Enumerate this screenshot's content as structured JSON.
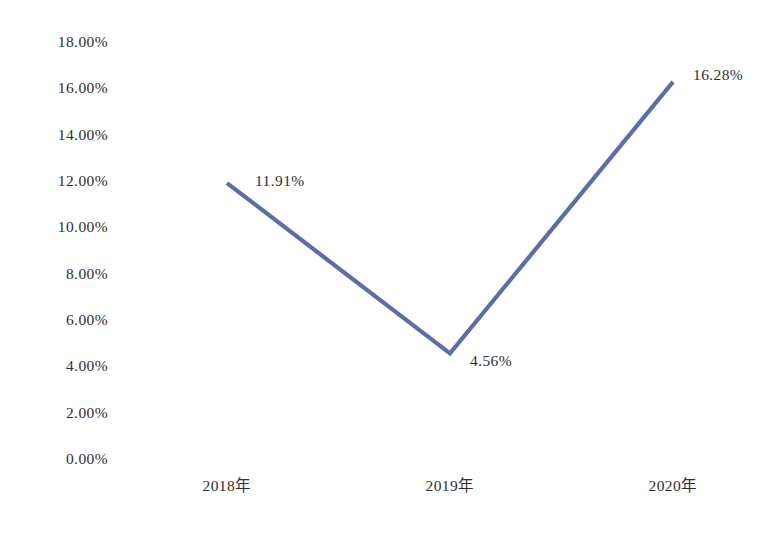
{
  "chart_data": {
    "type": "line",
    "title": "",
    "subtitle": "",
    "xlabel": "",
    "ylabel": "",
    "categories": [
      "2018年",
      "2019年",
      "2020年"
    ],
    "series": [
      {
        "name": "",
        "values": [
          11.91,
          4.56,
          16.28
        ],
        "labels": [
          "11.91%",
          "4.56%",
          "16.28%"
        ],
        "color": "#5b6ea8"
      }
    ],
    "ylim": [
      0,
      18
    ],
    "ytick_step": 2,
    "ytick_labels": [
      "18.00%",
      "16.00%",
      "14.00%",
      "12.00%",
      "10.00%",
      "8.00%",
      "6.00%",
      "4.00%",
      "2.00%",
      "0.00%"
    ],
    "ytick_values": [
      18,
      16,
      14,
      12,
      10,
      8,
      6,
      4,
      2,
      0
    ],
    "grid": false,
    "axis_lines": false,
    "legend": false,
    "legend_position": "none",
    "markers": false,
    "background_color": "#ffffff",
    "text_color": "#2f2f2f",
    "line_width": 4.2
  },
  "layout": {
    "plot_left": 227,
    "plot_right": 673,
    "y_top_px": 42,
    "y_bottom_px": 459,
    "y_top_value": 18,
    "y_bottom_value": 0,
    "x_label_y": 478,
    "label_offsets": [
      {
        "dx": 28,
        "dy": -2
      },
      {
        "dx": 20,
        "dy": 8
      },
      {
        "dx": 20,
        "dy": -7
      }
    ]
  }
}
